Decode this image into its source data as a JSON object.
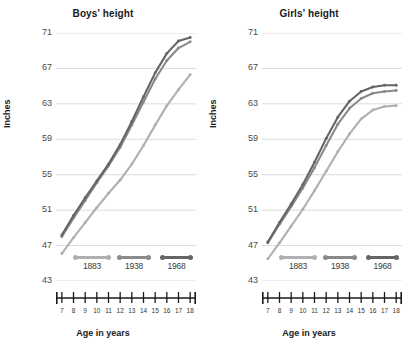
{
  "figure": {
    "xlabel": "Age in years",
    "ylabel": "Inches"
  },
  "colors": {
    "series_1883": "#b0b0b0",
    "series_1938": "#8a8a8a",
    "series_1968": "#656565",
    "gridline": "#dcdcdc",
    "axis": "#1a1a1a",
    "tick_text": "#4a4a4a",
    "title_text": "#1a1a1a"
  },
  "legend": {
    "position": "inside-bottom",
    "entries": [
      {
        "label": "1883",
        "color_key": "series_1883"
      },
      {
        "label": "1938",
        "color_key": "series_1938"
      },
      {
        "label": "1968",
        "color_key": "series_1968"
      }
    ]
  },
  "chart_data": [
    {
      "type": "line",
      "title": "Boys' height",
      "xlabel": "Age in years",
      "ylabel": "Inches",
      "x": [
        7,
        8,
        9,
        10,
        11,
        12,
        13,
        14,
        15,
        16,
        17,
        18
      ],
      "xlim": [
        6.5,
        18.5
      ],
      "ylim": [
        43,
        71
      ],
      "yticks": [
        43,
        47,
        51,
        55,
        59,
        63,
        67,
        71
      ],
      "xticks": [
        7,
        8,
        9,
        10,
        11,
        12,
        13,
        14,
        15,
        16,
        17,
        18
      ],
      "grid": true,
      "series": [
        {
          "name": "1883",
          "color": "#b0b0b0",
          "values": [
            46.1,
            47.9,
            49.6,
            51.3,
            52.9,
            54.4,
            56.2,
            58.3,
            60.6,
            62.8,
            64.6,
            66.3
          ]
        },
        {
          "name": "1938",
          "color": "#8a8a8a",
          "values": [
            48.0,
            50.1,
            52.1,
            54.1,
            56.0,
            58.1,
            60.6,
            63.2,
            65.8,
            67.9,
            69.3,
            70.0
          ]
        },
        {
          "name": "1968",
          "color": "#656565",
          "values": [
            48.2,
            50.4,
            52.4,
            54.3,
            56.2,
            58.4,
            61.0,
            63.8,
            66.5,
            68.7,
            70.1,
            70.5
          ]
        }
      ]
    },
    {
      "type": "line",
      "title": "Girls' height",
      "xlabel": "Age in years",
      "ylabel": "Inches",
      "x": [
        7,
        8,
        9,
        10,
        11,
        12,
        13,
        14,
        15,
        16,
        17,
        18
      ],
      "xlim": [
        6.5,
        18.5
      ],
      "ylim": [
        43,
        71
      ],
      "yticks": [
        43,
        47,
        51,
        55,
        59,
        63,
        67,
        71
      ],
      "xticks": [
        7,
        8,
        9,
        10,
        11,
        12,
        13,
        14,
        15,
        16,
        17,
        18
      ],
      "grid": true,
      "series": [
        {
          "name": "1883",
          "color": "#b0b0b0",
          "values": [
            45.5,
            47.3,
            49.2,
            51.1,
            53.2,
            55.4,
            57.6,
            59.6,
            61.3,
            62.3,
            62.7,
            62.8
          ]
        },
        {
          "name": "1938",
          "color": "#8a8a8a",
          "values": [
            47.3,
            49.4,
            51.4,
            53.5,
            55.8,
            58.3,
            60.7,
            62.5,
            63.6,
            64.2,
            64.4,
            64.5
          ]
        },
        {
          "name": "1968",
          "color": "#656565",
          "values": [
            47.4,
            49.6,
            51.7,
            53.9,
            56.4,
            59.1,
            61.5,
            63.3,
            64.4,
            64.9,
            65.1,
            65.1
          ]
        }
      ]
    }
  ]
}
